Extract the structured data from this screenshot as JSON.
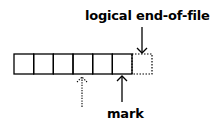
{
  "diagram": {
    "cells": 6,
    "labels": {
      "eof": "logical end-of-file",
      "mark": "mark"
    },
    "colors": {
      "ink": "#000000",
      "background": "#ffffff"
    }
  }
}
